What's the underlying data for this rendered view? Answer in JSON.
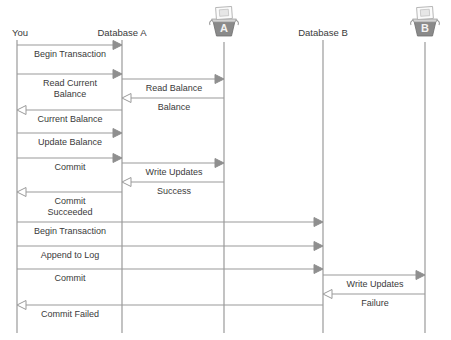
{
  "diagram": {
    "type": "sequence-diagram",
    "title": "",
    "width": 451,
    "height": 340,
    "background_color": "#ffffff",
    "line_color": "#9a9a9a",
    "text_color": "#3a3a3a",
    "filled_arrow_color": "#8f8f8f",
    "open_arrow_fill": "#ffffff",
    "icon_body_color": "#8a8a8a",
    "icon_letter_color": "#f2f2f2"
  },
  "lifelines": [
    {
      "id": "you",
      "label": "You",
      "x": 17,
      "label_x": 12,
      "label_y": 36,
      "label_anchor": "start",
      "top": 40,
      "bottom": 333,
      "has_icon": false
    },
    {
      "id": "database-a",
      "label": "Database A",
      "x": 122,
      "label_x": 122,
      "label_y": 36,
      "label_anchor": "middle",
      "top": 40,
      "bottom": 333,
      "has_icon": false
    },
    {
      "id": "server-a",
      "label": "A",
      "x": 224,
      "label_x": 224,
      "label_y": 36,
      "label_anchor": "middle",
      "top": 42,
      "bottom": 333,
      "has_icon": true,
      "icon_name": "database-bucket-icon",
      "icon_letter": "A",
      "icon_cx": 224,
      "icon_cy": 25
    },
    {
      "id": "database-b",
      "label": "Database B",
      "x": 323,
      "label_x": 323,
      "label_y": 36,
      "label_anchor": "middle",
      "top": 40,
      "bottom": 333,
      "has_icon": false
    },
    {
      "id": "server-b",
      "label": "B",
      "x": 425,
      "label_x": 425,
      "label_y": 36,
      "label_anchor": "middle",
      "top": 42,
      "bottom": 333,
      "has_icon": true,
      "icon_name": "database-bucket-icon",
      "icon_letter": "B",
      "icon_cx": 425,
      "icon_cy": 25
    }
  ],
  "messages": [
    {
      "index": 1,
      "label": "Begin Transaction",
      "from": "you",
      "to": "database-a",
      "from_x": 17,
      "to_x": 122,
      "y": 45,
      "direction": "right",
      "arrow_style": "filled",
      "label_x": 70,
      "label_y": 57,
      "label_lines": [
        "Begin Transaction"
      ]
    },
    {
      "index": 2,
      "label": "Read Current Balance",
      "from": "you",
      "to": "database-a",
      "from_x": 17,
      "to_x": 122,
      "y": 74,
      "direction": "right",
      "arrow_style": "filled",
      "label_x": 70,
      "label_y": 86,
      "label_lines": [
        "Read Current",
        "Balance"
      ]
    },
    {
      "index": 3,
      "label": "Read Balance",
      "from": "database-a",
      "to": "server-a",
      "from_x": 122,
      "to_x": 224,
      "y": 79,
      "direction": "right",
      "arrow_style": "filled",
      "label_x": 174,
      "label_y": 91,
      "label_lines": [
        "Read Balance"
      ]
    },
    {
      "index": 4,
      "label": "Balance",
      "from": "server-a",
      "to": "database-a",
      "from_x": 224,
      "to_x": 122,
      "y": 98,
      "direction": "left",
      "arrow_style": "open",
      "label_x": 174,
      "label_y": 110,
      "label_lines": [
        "Balance"
      ]
    },
    {
      "index": 5,
      "label": "Current Balance",
      "from": "database-a",
      "to": "you",
      "from_x": 122,
      "to_x": 17,
      "y": 110,
      "direction": "left",
      "arrow_style": "open",
      "label_x": 70,
      "label_y": 122,
      "label_lines": [
        "Current Balance"
      ]
    },
    {
      "index": 6,
      "label": "Update Balance",
      "from": "you",
      "to": "database-a",
      "from_x": 17,
      "to_x": 122,
      "y": 133,
      "direction": "right",
      "arrow_style": "filled",
      "label_x": 70,
      "label_y": 145,
      "label_lines": [
        "Update Balance"
      ]
    },
    {
      "index": 7,
      "label": "Commit",
      "from": "you",
      "to": "database-a",
      "from_x": 17,
      "to_x": 122,
      "y": 158,
      "direction": "right",
      "arrow_style": "filled",
      "label_x": 70,
      "label_y": 170,
      "label_lines": [
        "Commit"
      ]
    },
    {
      "index": 8,
      "label": "Write Updates",
      "from": "database-a",
      "to": "server-a",
      "from_x": 122,
      "to_x": 224,
      "y": 163,
      "direction": "right",
      "arrow_style": "filled",
      "label_x": 174,
      "label_y": 175,
      "label_lines": [
        "Write Updates"
      ]
    },
    {
      "index": 9,
      "label": "Success",
      "from": "server-a",
      "to": "database-a",
      "from_x": 224,
      "to_x": 122,
      "y": 182,
      "direction": "left",
      "arrow_style": "open",
      "label_x": 174,
      "label_y": 194,
      "label_lines": [
        "Success"
      ]
    },
    {
      "index": 10,
      "label": "Commit Succeeded",
      "from": "database-a",
      "to": "you",
      "from_x": 122,
      "to_x": 17,
      "y": 192,
      "direction": "left",
      "arrow_style": "open",
      "label_x": 70,
      "label_y": 204,
      "label_lines": [
        "Commit",
        "Succeeded"
      ]
    },
    {
      "index": 11,
      "label": "Begin Transaction",
      "from": "you",
      "to": "database-b",
      "from_x": 17,
      "to_x": 323,
      "y": 222,
      "direction": "right",
      "arrow_style": "filled",
      "label_x": 70,
      "label_y": 234,
      "label_lines": [
        "Begin Transaction"
      ]
    },
    {
      "index": 12,
      "label": "Append to Log",
      "from": "you",
      "to": "database-b",
      "from_x": 17,
      "to_x": 323,
      "y": 246,
      "direction": "right",
      "arrow_style": "filled",
      "label_x": 70,
      "label_y": 258,
      "label_lines": [
        "Append to Log"
      ]
    },
    {
      "index": 13,
      "label": "Commit",
      "from": "you",
      "to": "database-b",
      "from_x": 17,
      "to_x": 323,
      "y": 269,
      "direction": "right",
      "arrow_style": "filled",
      "label_x": 70,
      "label_y": 281,
      "label_lines": [
        "Commit"
      ]
    },
    {
      "index": 14,
      "label": "Write Updates",
      "from": "database-b",
      "to": "server-b",
      "from_x": 323,
      "to_x": 425,
      "y": 275,
      "direction": "right",
      "arrow_style": "filled",
      "label_x": 375,
      "label_y": 287,
      "label_lines": [
        "Write Updates"
      ]
    },
    {
      "index": 15,
      "label": "Failure",
      "from": "server-b",
      "to": "database-b",
      "from_x": 425,
      "to_x": 323,
      "y": 294,
      "direction": "left",
      "arrow_style": "open",
      "label_x": 375,
      "label_y": 306,
      "label_lines": [
        "Failure"
      ]
    },
    {
      "index": 16,
      "label": "Commit Failed",
      "from": "database-b",
      "to": "you",
      "from_x": 323,
      "to_x": 17,
      "y": 305,
      "direction": "left",
      "arrow_style": "open",
      "label_x": 70,
      "label_y": 317,
      "label_lines": [
        "Commit Failed"
      ]
    }
  ]
}
